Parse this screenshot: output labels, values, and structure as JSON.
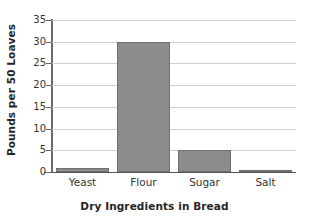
{
  "chart_data": {
    "type": "bar",
    "title": "Dry Ingredients in Bread",
    "subtitle": "",
    "xlabel": "Dry Ingredients in Bread",
    "ylabel": "Pounds per 50 Loaves",
    "categories": [
      "Yeast",
      "Flour",
      "Sugar",
      "Salt"
    ],
    "values": [
      1,
      30,
      5,
      0.5
    ],
    "ylim": [
      0,
      35
    ],
    "yticks": [
      0,
      5,
      10,
      15,
      20,
      25,
      30,
      35
    ],
    "ytick_labels": [
      "0",
      "5",
      "10",
      "15",
      "20",
      "25",
      "30",
      "35"
    ],
    "grid": true,
    "legend": false,
    "legend_position": "none",
    "orientation": "vertical",
    "colors": {
      "bar_fill": "#8c8c8c",
      "bar_edge": "#6f6f6f",
      "gridline": "#cfcfcf",
      "axis": "#555555",
      "text": "#252525",
      "background": "#ffffff"
    }
  }
}
